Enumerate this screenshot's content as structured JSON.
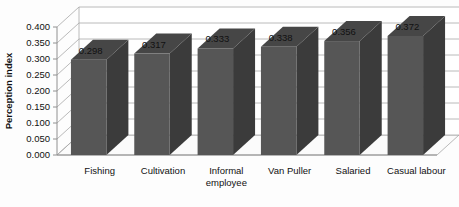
{
  "chart_data": {
    "type": "bar",
    "title": "",
    "xlabel": "",
    "ylabel": "Perception index",
    "categories": [
      "Fishing",
      "Cultivation",
      "Informal employee",
      "Van Puller",
      "Salaried",
      "Casual labour"
    ],
    "values": [
      0.298,
      0.317,
      0.333,
      0.338,
      0.356,
      0.372
    ],
    "value_labels": [
      "0.298",
      "0.317",
      "0.333",
      "0.338",
      "0.356",
      "0.372"
    ],
    "ylim": [
      0.0,
      0.4
    ],
    "ytick_step": 0.05,
    "ytick_labels": [
      "0.000",
      "0.050",
      "0.100",
      "0.150",
      "0.200",
      "0.250",
      "0.300",
      "0.350",
      "0.400"
    ],
    "ytick_values": [
      0.0,
      0.05,
      0.1,
      0.15,
      0.2,
      0.25,
      0.3,
      0.35,
      0.4
    ],
    "grid": true,
    "legend": false,
    "style": "3d-column",
    "colors": {
      "bar_front": "#565656",
      "bar_side": "#3b3b3b",
      "bar_top": "#464646",
      "gridline": "#a8a8a8",
      "background": "#fdfdfd",
      "text": "#111111"
    }
  },
  "category_label_lines": [
    [
      "Fishing"
    ],
    [
      "Cultivation"
    ],
    [
      "Informal",
      "employee"
    ],
    [
      "Van Puller"
    ],
    [
      "Salaried"
    ],
    [
      "Casual labour"
    ]
  ]
}
